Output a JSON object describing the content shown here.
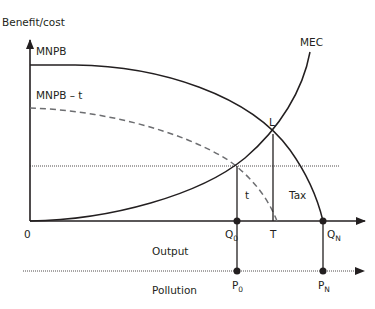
{
  "diagram": {
    "y_axis_label": "Benefit/cost",
    "origin_label": "0",
    "x_axis_label": "Output",
    "pollution_axis_label": "Pollution",
    "curves": {
      "mnpb": "MNPB",
      "mnpb_t": "MNPB – t",
      "mec": "MEC"
    },
    "points": {
      "L": "L",
      "Q0": {
        "main": "Q",
        "sub": "0"
      },
      "T": "T",
      "QN": {
        "main": "Q",
        "sub": "N"
      },
      "P0": {
        "main": "P",
        "sub": "0"
      },
      "PN": {
        "main": "P",
        "sub": "N"
      }
    },
    "regions": {
      "t": "t",
      "tax": "Tax"
    },
    "colors": {
      "line": "#231f20",
      "dashed": "#6d6e71"
    }
  }
}
